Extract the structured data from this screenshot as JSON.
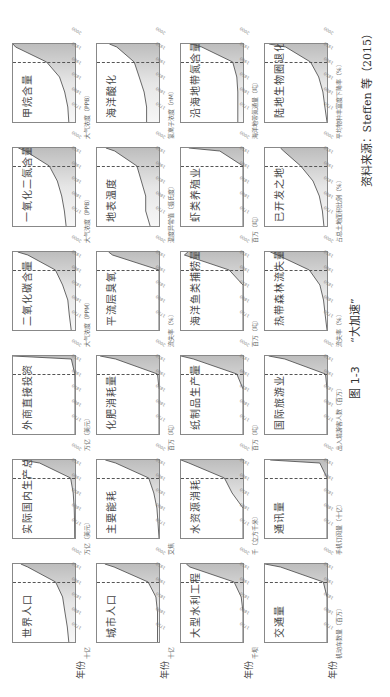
{
  "figure": {
    "number": "图 1-3",
    "title": "“大加速”",
    "source": "资料来源：Steffen 等（2015）",
    "year_axis_label": "年份"
  },
  "chart_data": [
    {
      "type": "area",
      "title": "世界人口",
      "ylabel": "十亿",
      "xlabel": "年份",
      "x": [
        1750,
        1800,
        1850,
        1900,
        1950,
        2000,
        2010
      ],
      "values": [
        0.8,
        1.0,
        1.3,
        1.6,
        2.5,
        6.1,
        7.0
      ],
      "ylim": [
        0,
        8
      ]
    },
    {
      "type": "area",
      "title": "实际国内生产总值",
      "ylabel": "万亿（美元）",
      "x": [
        1750,
        1800,
        1850,
        1900,
        1950,
        2000,
        2010
      ],
      "values": [
        0.3,
        0.5,
        0.9,
        2,
        5,
        40,
        60
      ],
      "ylim": [
        0,
        70
      ]
    },
    {
      "type": "area",
      "title": "外商直接投资",
      "ylabel": "万亿（美元）",
      "x": [
        1750,
        1800,
        1850,
        1900,
        1950,
        2000,
        2010
      ],
      "values": [
        0,
        0,
        0,
        0,
        0.1,
        1.5,
        25
      ],
      "ylim": [
        0,
        25
      ]
    },
    {
      "type": "area",
      "title": "二氧化碳含量",
      "ylabel": "大气浓度（PPM）",
      "x": [
        1750,
        1800,
        1850,
        1900,
        1950,
        2000,
        2010
      ],
      "values": [
        278,
        282,
        285,
        296,
        311,
        369,
        390
      ],
      "ylim": [
        270,
        400
      ]
    },
    {
      "type": "area",
      "title": "一氧化二氮含量",
      "ylabel": "大气浓度（PPB）",
      "x": [
        1750,
        1800,
        1850,
        1900,
        1950,
        2000,
        2010
      ],
      "values": [
        270,
        272,
        275,
        280,
        289,
        316,
        324
      ],
      "ylim": [
        260,
        330
      ]
    },
    {
      "type": "area",
      "title": "甲烷含量",
      "ylabel": "大气浓度（PPB）",
      "x": [
        1750,
        1800,
        1850,
        1900,
        1950,
        2000,
        2010
      ],
      "values": [
        720,
        740,
        800,
        900,
        1150,
        1750,
        1800
      ],
      "ylim": [
        600,
        1800
      ]
    },
    {
      "type": "area",
      "title": "城市人口",
      "ylabel": "十亿",
      "xlabel": "年份",
      "x": [
        1750,
        1800,
        1850,
        1900,
        1950,
        2000,
        2010
      ],
      "values": [
        0.1,
        0.1,
        0.1,
        0.2,
        0.7,
        2.9,
        3.5
      ],
      "ylim": [
        0,
        4
      ]
    },
    {
      "type": "area",
      "title": "主要能耗",
      "ylabel": "艾焦",
      "x": [
        1750,
        1800,
        1850,
        1900,
        1950,
        2000,
        2010
      ],
      "values": [
        0,
        10,
        20,
        50,
        100,
        420,
        520
      ],
      "ylim": [
        0,
        600
      ]
    },
    {
      "type": "area",
      "title": "化肥消耗量",
      "ylabel": "百万（吨）",
      "x": [
        1750,
        1800,
        1850,
        1900,
        1950,
        2000,
        2010
      ],
      "values": [
        0,
        0,
        0,
        0,
        5,
        140,
        190
      ],
      "ylim": [
        0,
        200
      ]
    },
    {
      "type": "area",
      "title": "平流层臭氧",
      "ylabel": "流失率（%）",
      "x": [
        1750,
        1800,
        1850,
        1900,
        1950,
        2000,
        2010
      ],
      "values": [
        0,
        0,
        0,
        0,
        0,
        60,
        65
      ],
      "ylim": [
        0,
        80
      ]
    },
    {
      "type": "area",
      "title": "地表温度",
      "ylabel": "温度异常值（摄氏度）",
      "x": [
        1750,
        1800,
        1850,
        1900,
        1950,
        2000,
        2010
      ],
      "values": [
        -0.4,
        -0.3,
        -0.3,
        -0.2,
        -0.1,
        0.4,
        0.6
      ],
      "ylim": [
        -0.6,
        0.8
      ]
    },
    {
      "type": "area",
      "title": "海洋酸化",
      "ylabel": "氢离子浓度（nM）",
      "x": [
        1750,
        1800,
        1850,
        1900,
        1950,
        2000,
        2010
      ],
      "values": [
        6.5,
        6.5,
        6.6,
        6.8,
        7.0,
        7.7,
        8.0
      ],
      "ylim": [
        6,
        8.5
      ]
    },
    {
      "type": "area",
      "title": "大型水利工程",
      "ylabel": "千坝",
      "xlabel": "年份",
      "x": [
        1750,
        1800,
        1850,
        1900,
        1950,
        2000,
        2010
      ],
      "values": [
        0,
        0,
        0,
        1,
        5,
        30,
        32
      ],
      "ylim": [
        0,
        35
      ]
    },
    {
      "type": "area",
      "title": "水资源消耗",
      "ylabel": "千（立方千米）",
      "x": [
        1750,
        1800,
        1850,
        1900,
        1950,
        2000,
        2010
      ],
      "values": [
        0,
        0,
        0,
        0.7,
        1.2,
        3.5,
        4
      ],
      "ylim": [
        0,
        4
      ]
    },
    {
      "type": "area",
      "title": "纸制品生产量",
      "ylabel": "百万（吨）",
      "x": [
        1750,
        1800,
        1850,
        1900,
        1950,
        2000,
        2010
      ],
      "values": [
        0,
        0,
        0,
        0,
        40,
        320,
        400
      ],
      "ylim": [
        0,
        400
      ]
    },
    {
      "type": "area",
      "title": "海洋鱼类捕捞量",
      "ylabel": "百万（吨）",
      "x": [
        1750,
        1800,
        1850,
        1900,
        1950,
        2000,
        2010
      ],
      "values": [
        0,
        0,
        0,
        0,
        20,
        85,
        80
      ],
      "ylim": [
        0,
        90
      ]
    },
    {
      "type": "area",
      "title": "虾类养殖业",
      "ylabel": "百万（吨）",
      "x": [
        1750,
        1800,
        1850,
        1900,
        1950,
        2000,
        2010
      ],
      "values": [
        0,
        0,
        0,
        0,
        0,
        1.5,
        3.5
      ],
      "ylim": [
        0,
        4
      ]
    },
    {
      "type": "area",
      "title": "沿海地带氮含量",
      "ylabel": "海洋地带氮通量（吨）",
      "x": [
        1750,
        1800,
        1850,
        1900,
        1950,
        2000,
        2010
      ],
      "values": [
        5,
        5,
        5,
        6,
        10,
        40,
        50
      ],
      "ylim": [
        0,
        60
      ]
    },
    {
      "type": "area",
      "title": "交通量",
      "ylabel": "机动车数量（百万）",
      "xlabel": "年份",
      "x": [
        1750,
        1800,
        1850,
        1900,
        1950,
        2000,
        2010
      ],
      "values": [
        0,
        0,
        0,
        0,
        60,
        750,
        1000
      ],
      "ylim": [
        0,
        1000
      ]
    },
    {
      "type": "area",
      "title": "通讯量",
      "ylabel": "手机订阅量（十亿）",
      "x": [
        1750,
        1800,
        1850,
        1900,
        1950,
        2000,
        2010
      ],
      "values": [
        0,
        0,
        0,
        0,
        0,
        0.7,
        5.5
      ],
      "ylim": [
        0,
        6
      ]
    },
    {
      "type": "area",
      "title": "国际旅游业",
      "ylabel": "出入境游客人数（百万）",
      "x": [
        1750,
        1800,
        1850,
        1900,
        1950,
        2000,
        2010
      ],
      "values": [
        0,
        0,
        0,
        0,
        25,
        680,
        940
      ],
      "ylim": [
        0,
        1000
      ]
    },
    {
      "type": "area",
      "title": "热带森林流失量",
      "ylabel": "流失率（%）",
      "x": [
        1750,
        1800,
        1850,
        1900,
        1950,
        2000,
        2010
      ],
      "values": [
        0,
        1,
        2,
        4,
        10,
        28,
        32
      ],
      "ylim": [
        0,
        35
      ]
    },
    {
      "type": "area",
      "title": "已开发之地",
      "ylabel": "占总土地面积比例（%）",
      "x": [
        1750,
        1800,
        1850,
        1900,
        1950,
        2000,
        2010
      ],
      "values": [
        2,
        3,
        5,
        9,
        17,
        28,
        30
      ],
      "ylim": [
        0,
        40
      ]
    },
    {
      "type": "area",
      "title": "陆地生物圈退化",
      "ylabel": "平均物种丰富度下降率（%）",
      "x": [
        1750,
        1800,
        1850,
        1900,
        1950,
        2000,
        2010
      ],
      "values": [
        0,
        1,
        2,
        4,
        8,
        20,
        28
      ],
      "ylim": [
        0,
        30
      ]
    }
  ],
  "xticks": [
    "1750",
    "1800",
    "1850",
    "1900",
    "1950",
    "2000"
  ]
}
